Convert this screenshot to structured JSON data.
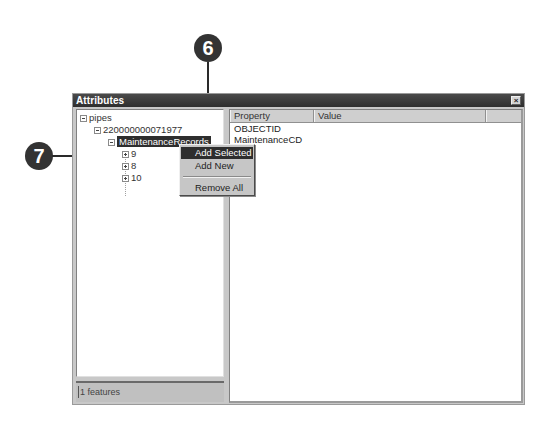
{
  "window": {
    "title": "Attributes",
    "close_glyph": "×"
  },
  "tree": {
    "nodes": [
      {
        "label": "pipes",
        "toggle": "minus"
      },
      {
        "label": "220000000071977",
        "toggle": "minus"
      },
      {
        "label": "MaintenanceRecords",
        "toggle": "minus",
        "selected": true
      },
      {
        "label": "9",
        "toggle": "plus"
      },
      {
        "label": "8",
        "toggle": "plus"
      },
      {
        "label": "10",
        "toggle": "plus"
      }
    ]
  },
  "status": {
    "text": "1 features"
  },
  "grid": {
    "columns": [
      "Property",
      "Value"
    ],
    "rows": [
      {
        "property": "OBJECTID",
        "value": ""
      },
      {
        "property": "MaintenanceCD",
        "value": ""
      }
    ]
  },
  "context_menu": {
    "items": [
      {
        "label": "Add Selected",
        "active": true
      },
      {
        "label": "Add New",
        "active": false
      },
      {
        "label": "Remove All",
        "active": false
      }
    ]
  },
  "callouts": [
    {
      "number": "6"
    },
    {
      "number": "7"
    }
  ],
  "colors": {
    "titlebar": "#2e2e2e",
    "selection": "#2e2e2e",
    "callout": "#333333",
    "panel": "#c8c8c8"
  }
}
